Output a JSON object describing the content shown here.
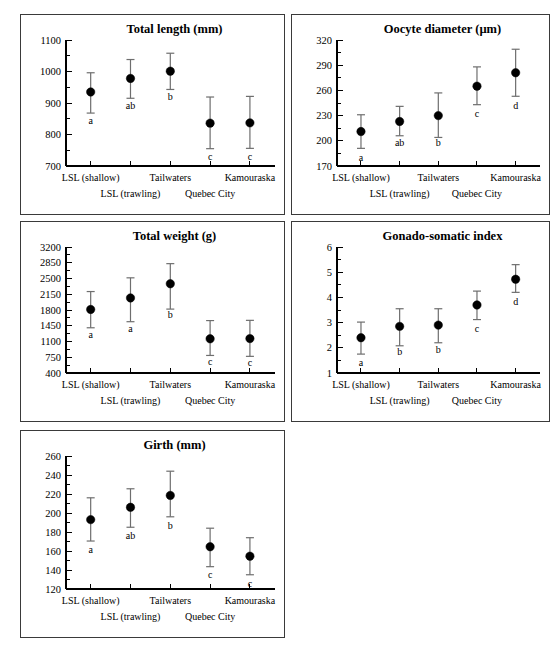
{
  "figure": {
    "name": "multi-panel-error-bar-figure",
    "panel_count": 5,
    "colors": {
      "point": "#000000",
      "error_bar": "#6e6e6e",
      "axis": "#000000",
      "panel_border": "#3a3a3a",
      "background": "#ffffff"
    }
  },
  "shared": {
    "categories": [
      "LSL (shallow)",
      "",
      "Tailwaters",
      "",
      "Kamouraska"
    ],
    "category_tick_labels": [
      "LSL (shallow)",
      "Tailwaters",
      "Kamouraska"
    ],
    "group_labels": [
      "LSL (trawling)",
      "Quebec City"
    ],
    "n_categories": 5
  },
  "chart_data": [
    {
      "id": "total-length",
      "type": "scatter",
      "title": "Total length (mm)",
      "xlabel": "",
      "ylabel": "",
      "categories": [
        "LSL (shallow)",
        "",
        "Tailwaters",
        "",
        "Kamouraska"
      ],
      "values": [
        935,
        978,
        1001,
        836,
        837
      ],
      "err_low": [
        868,
        915,
        943,
        755,
        756
      ],
      "err_high": [
        996,
        1038,
        1058,
        919,
        921
      ],
      "letters": [
        "a",
        "ab",
        "b",
        "c",
        "c"
      ],
      "letter_y": [
        843,
        892,
        920,
        730,
        730
      ],
      "ylim": [
        700,
        1100
      ],
      "yticks": [
        700,
        800,
        900,
        1000,
        1100
      ],
      "ytick_labels": [
        "700",
        "800",
        "900",
        "1000",
        "1100"
      ],
      "yminor_step": 50,
      "grid": false,
      "legend": "none"
    },
    {
      "id": "oocyte-diameter",
      "type": "scatter",
      "title": "Oocyte diameter (µm)",
      "xlabel": "",
      "ylabel": "",
      "categories": [
        "LSL (shallow)",
        "",
        "Tailwaters",
        "",
        "Kamouraska"
      ],
      "values": [
        211,
        223,
        230,
        265,
        281
      ],
      "err_low": [
        191,
        206,
        204,
        243,
        253
      ],
      "err_high": [
        231,
        241,
        257,
        288,
        309
      ],
      "letters": [
        "a",
        "ab",
        "b",
        "c",
        "d"
      ],
      "letter_y": [
        180,
        198,
        198,
        232,
        242
      ],
      "ylim": [
        170,
        320
      ],
      "yticks": [
        170,
        200,
        230,
        260,
        290,
        320
      ],
      "ytick_labels": [
        "170",
        "200",
        "230",
        "260",
        "290",
        "320"
      ],
      "yminor_step": 15,
      "grid": false,
      "legend": "none"
    },
    {
      "id": "total-weight",
      "type": "scatter",
      "title": "Total weight (g)",
      "xlabel": "",
      "ylabel": "",
      "categories": [
        "LSL (shallow)",
        "",
        "Tailwaters",
        "",
        "Kamouraska"
      ],
      "values": [
        1812,
        2068,
        2383,
        1160,
        1165
      ],
      "err_low": [
        1405,
        1540,
        1820,
        790,
        770
      ],
      "err_high": [
        2210,
        2515,
        2830,
        1565,
        1570
      ],
      "letters": [
        "a",
        "a",
        "b",
        "c",
        "c"
      ],
      "letter_y": [
        1265,
        1400,
        1700,
        655,
        640
      ],
      "ylim": [
        400,
        3200
      ],
      "yticks": [
        400,
        750,
        1100,
        1450,
        1800,
        2150,
        2500,
        2850,
        3200
      ],
      "ytick_labels": [
        "400",
        "750",
        "1100",
        "1450",
        "1800",
        "2150",
        "2500",
        "2850",
        "3200"
      ],
      "yminor_step": 175,
      "grid": false,
      "legend": "none"
    },
    {
      "id": "gonado-somatic-index",
      "type": "scatter",
      "title": "Gonado-somatic index",
      "xlabel": "",
      "ylabel": "",
      "categories": [
        "LSL (shallow)",
        "",
        "Tailwaters",
        "",
        "Kamouraska"
      ],
      "values": [
        2.4,
        2.85,
        2.9,
        3.7,
        4.72
      ],
      "err_low": [
        1.75,
        2.08,
        2.2,
        3.12,
        4.2
      ],
      "err_high": [
        3.02,
        3.55,
        3.55,
        4.25,
        5.3
      ],
      "letters": [
        "a",
        "b",
        "b",
        "c",
        "d"
      ],
      "letter_y": [
        1.42,
        1.85,
        1.95,
        2.78,
        3.85
      ],
      "ylim": [
        1,
        6
      ],
      "yticks": [
        1,
        2,
        3,
        4,
        5,
        6
      ],
      "ytick_labels": [
        "1",
        "2",
        "3",
        "4",
        "5",
        "6"
      ],
      "yminor_step": 0.5,
      "grid": false,
      "legend": "none"
    },
    {
      "id": "girth",
      "type": "scatter",
      "title": "Girth (mm)",
      "xlabel": "",
      "ylabel": "",
      "categories": [
        "LSL (shallow)",
        "",
        "Tailwaters",
        "",
        "Kamouraska"
      ],
      "values": [
        193,
        206,
        218.5,
        164.5,
        154.5
      ],
      "err_low": [
        170.5,
        185,
        196,
        143.5,
        135
      ],
      "err_high": [
        216,
        225.5,
        244,
        184,
        174
      ],
      "letters": [
        "a",
        "ab",
        "b",
        "c",
        "c"
      ],
      "letter_y": [
        162,
        176,
        187,
        135,
        126
      ],
      "ylim": [
        120,
        260
      ],
      "yticks": [
        120,
        140,
        160,
        180,
        200,
        220,
        240,
        260
      ],
      "ytick_labels": [
        "120",
        "140",
        "160",
        "180",
        "200",
        "220",
        "240",
        "260"
      ],
      "yminor_step": 10,
      "grid": false,
      "legend": "none"
    }
  ]
}
